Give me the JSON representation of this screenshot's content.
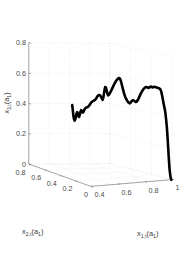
{
  "figure": {
    "background_color": "#ffffff",
    "grid_color": "#d8d8d8",
    "axis_color": "#808080",
    "curve_color": "#000000"
  },
  "chart_data": {
    "type": "line",
    "projection": "3d",
    "title": "",
    "subtitle": "",
    "xlabel": "x_{1,t}(a_1)",
    "ylabel": "x_{2,t}(a_1)",
    "zlabel": "x_{3,t}(a_1)",
    "xlabel_parts": {
      "base": "x",
      "sub": "1,t",
      "arg": "(a",
      "argsub": "1",
      "argclose": ")"
    },
    "ylabel_parts": {
      "base": "x",
      "sub": "2,t",
      "arg": "(a",
      "argsub": "1",
      "argclose": ")"
    },
    "zlabel_parts": {
      "base": "x",
      "sub": "3,t",
      "arg": "(a",
      "argsub": "1",
      "argclose": ")"
    },
    "xticks": [
      0.4,
      0.6,
      0.8,
      1
    ],
    "xtick_labels": [
      "0.4",
      "0.6",
      "0.8",
      "1"
    ],
    "yticks": [
      0,
      0.2,
      0.4,
      0.6,
      0.8
    ],
    "ytick_labels": [
      "0",
      "0.2",
      "0.4",
      "0.6",
      "0.8"
    ],
    "zticks": [
      0,
      0.2,
      0.4,
      0.6,
      0.8
    ],
    "ztick_labels": [
      "0",
      "0.2",
      "0.4",
      "0.6",
      "0.8"
    ],
    "xlim": [
      0.4,
      1.0
    ],
    "ylim": [
      0.0,
      0.8
    ],
    "zlim": [
      0.0,
      0.8
    ],
    "grid": true,
    "legend": null,
    "series": [
      {
        "name": "trajectory",
        "color": "#000000",
        "linewidth": 2.6,
        "screen_points": [
          [
            72.2,
            105.0
          ],
          [
            72.6,
            108.4
          ],
          [
            73.0,
            112.0
          ],
          [
            73.4,
            115.6
          ],
          [
            73.9,
            118.8
          ],
          [
            74.6,
            120.6
          ],
          [
            75.4,
            119.0
          ],
          [
            76.0,
            116.0
          ],
          [
            76.6,
            113.4
          ],
          [
            77.2,
            112.2
          ],
          [
            77.8,
            113.4
          ],
          [
            78.4,
            115.8
          ],
          [
            79.0,
            117.0
          ],
          [
            79.7,
            115.0
          ],
          [
            80.4,
            112.0
          ],
          [
            81.1,
            110.2
          ],
          [
            81.9,
            111.0
          ],
          [
            82.6,
            112.6
          ],
          [
            83.4,
            112.0
          ],
          [
            84.2,
            110.0
          ],
          [
            85.0,
            108.6
          ],
          [
            85.9,
            107.8
          ],
          [
            86.8,
            107.4
          ],
          [
            87.7,
            107.0
          ],
          [
            88.6,
            106.2
          ],
          [
            89.5,
            105.0
          ],
          [
            90.4,
            103.6
          ],
          [
            91.3,
            102.4
          ],
          [
            92.2,
            101.6
          ],
          [
            93.2,
            101.0
          ],
          [
            94.2,
            100.4
          ],
          [
            95.2,
            99.8
          ],
          [
            96.2,
            98.4
          ],
          [
            97.2,
            96.6
          ],
          [
            98.2,
            95.4
          ],
          [
            99.2,
            95.0
          ],
          [
            100.2,
            95.4
          ],
          [
            101.0,
            96.6
          ],
          [
            101.8,
            98.4
          ],
          [
            102.6,
            99.8
          ],
          [
            103.4,
            97.4
          ],
          [
            104.0,
            93.4
          ],
          [
            104.6,
            89.6
          ],
          [
            105.2,
            87.0
          ],
          [
            105.9,
            87.6
          ],
          [
            106.6,
            90.4
          ],
          [
            107.4,
            93.6
          ],
          [
            108.2,
            95.4
          ],
          [
            109.0,
            94.6
          ],
          [
            109.9,
            93.0
          ],
          [
            110.8,
            91.4
          ],
          [
            111.7,
            89.6
          ],
          [
            112.6,
            87.6
          ],
          [
            113.5,
            85.6
          ],
          [
            114.4,
            83.8
          ],
          [
            115.3,
            82.2
          ],
          [
            116.2,
            80.8
          ],
          [
            117.1,
            79.6
          ],
          [
            118.0,
            78.6
          ],
          [
            118.9,
            78.0
          ],
          [
            119.8,
            78.4
          ],
          [
            120.6,
            80.2
          ],
          [
            121.4,
            83.0
          ],
          [
            122.2,
            86.2
          ],
          [
            123.0,
            89.4
          ],
          [
            123.8,
            92.4
          ],
          [
            124.6,
            95.0
          ],
          [
            125.4,
            97.2
          ],
          [
            126.2,
            99.0
          ],
          [
            127.0,
            100.4
          ],
          [
            127.8,
            101.6
          ],
          [
            128.6,
            102.6
          ],
          [
            129.5,
            103.4
          ],
          [
            130.4,
            103.0
          ],
          [
            131.3,
            101.6
          ],
          [
            132.2,
            100.6
          ],
          [
            133.1,
            100.2
          ],
          [
            134.0,
            100.6
          ],
          [
            134.9,
            101.4
          ],
          [
            135.8,
            102.0
          ],
          [
            136.7,
            101.6
          ],
          [
            137.6,
            100.4
          ],
          [
            138.5,
            98.6
          ],
          [
            139.4,
            96.6
          ],
          [
            140.3,
            94.6
          ],
          [
            141.2,
            92.8
          ],
          [
            142.1,
            91.2
          ],
          [
            143.0,
            89.8
          ],
          [
            143.9,
            88.6
          ],
          [
            144.8,
            87.8
          ],
          [
            145.7,
            87.2
          ],
          [
            146.6,
            87.0
          ],
          [
            147.5,
            87.4
          ],
          [
            148.4,
            88.0
          ],
          [
            149.3,
            87.6
          ],
          [
            150.1,
            86.8
          ],
          [
            150.9,
            86.6
          ],
          [
            151.7,
            87.0
          ],
          [
            152.5,
            87.4
          ],
          [
            153.3,
            87.2
          ],
          [
            154.1,
            86.8
          ],
          [
            154.9,
            86.8
          ],
          [
            155.7,
            87.2
          ],
          [
            156.5,
            87.6
          ],
          [
            157.3,
            87.8
          ],
          [
            158.1,
            88.0
          ],
          [
            158.9,
            88.2
          ],
          [
            159.7,
            88.6
          ],
          [
            160.5,
            89.6
          ],
          [
            161.2,
            91.4
          ],
          [
            161.8,
            94.0
          ],
          [
            162.4,
            97.0
          ],
          [
            163.0,
            100.2
          ],
          [
            163.6,
            103.4
          ],
          [
            164.2,
            106.4
          ],
          [
            164.8,
            109.2
          ],
          [
            165.3,
            112.2
          ],
          [
            165.7,
            115.6
          ],
          [
            166.1,
            119.4
          ],
          [
            166.5,
            123.4
          ],
          [
            166.9,
            127.6
          ],
          [
            167.2,
            132.0
          ],
          [
            167.5,
            136.6
          ],
          [
            167.8,
            141.4
          ],
          [
            168.1,
            146.4
          ],
          [
            168.4,
            151.4
          ],
          [
            168.7,
            156.4
          ],
          [
            169.0,
            161.2
          ],
          [
            169.3,
            165.6
          ],
          [
            169.6,
            169.6
          ],
          [
            170.0,
            173.2
          ],
          [
            170.4,
            176.2
          ],
          [
            170.9,
            178.4
          ],
          [
            171.4,
            179.8
          ]
        ]
      }
    ]
  },
  "geometry": {
    "origin": [
      91.0,
      186.4
    ],
    "x_axis_end": [
      172.0,
      179.6
    ],
    "y_axis_end": [
      28.8,
      164.0
    ],
    "z_axis_end": [
      28.8,
      42.6
    ],
    "z_origin": [
      28.8,
      164.0
    ],
    "back_corner": [
      111.0,
      20.0
    ]
  }
}
